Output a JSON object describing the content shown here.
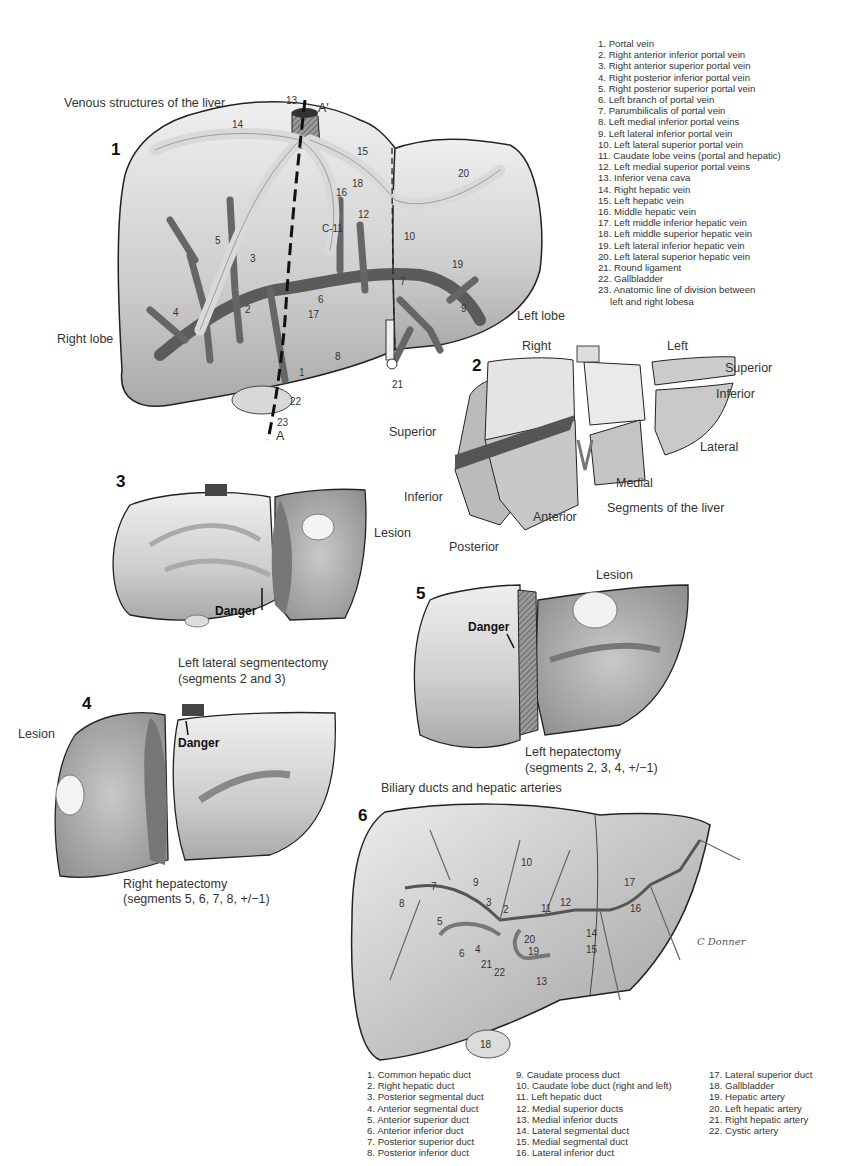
{
  "figure1": {
    "number": "1",
    "title": "Venous structures of the liver",
    "right_lobe_label": "Right lobe",
    "left_lobe_label": "Left lobe",
    "axis_top": "A′",
    "axis_bottom": "A",
    "markers": [
      "1",
      "2",
      "3",
      "4",
      "5",
      "6",
      "7",
      "8",
      "9",
      "10",
      "C-11",
      "12",
      "13",
      "14",
      "15",
      "16",
      "17",
      "18",
      "19",
      "20",
      "21",
      "22",
      "23"
    ],
    "legend": [
      "1. Portal vein",
      "2. Right anterior inferior portal vein",
      "3. Right anterior superior portal vein",
      "4. Right posterior inferior portal vein",
      "5. Right posterior superior portal vein",
      "6. Left branch of portal vein",
      "7. Parumbilicalis of portal vein",
      "8. Left medial inferior portal veins",
      "9. Left lateral inferior portal vein",
      "10. Left lateral superior portal vein",
      "11. Caudate lobe veins (portal and hepatic)",
      "12. Left medial superior portal veins",
      "13. Inferior vena cava",
      "14. Right hepatic vein",
      "15. Left hepatic vein",
      "16. Middle hepatic vein",
      "17.  Left middle inferior hepatic vein",
      "18. Left middle superior hepatic vein",
      "19. Left lateral inferior hepatic vein",
      "20. Left lateral superior hepatic vein",
      "21. Round ligament",
      "22. Gallbladder",
      "23. Anatomic line of division between",
      "left and right lobesa"
    ]
  },
  "figure2": {
    "number": "2",
    "title": "Segments of the liver",
    "labels": {
      "right": "Right",
      "left": "Left",
      "superior_left": "Superior",
      "inferior_left": "Inferior",
      "lateral": "Lateral",
      "superior_right": "Superior",
      "inferior_right": "Inferior",
      "medial": "Medial",
      "anterior": "Anterior",
      "posterior": "Posterior"
    }
  },
  "figure3": {
    "number": "3",
    "lesion": "Lesion",
    "danger": "Danger",
    "caption_line1": "Left lateral segmentectomy",
    "caption_line2": "(segments 2 and 3)"
  },
  "figure4": {
    "number": "4",
    "lesion": "Lesion",
    "danger": "Danger",
    "caption_line1": "Right hepatectomy",
    "caption_line2": "(segments 5, 6, 7, 8, +/−1)"
  },
  "figure5": {
    "number": "5",
    "lesion": "Lesion",
    "danger": "Danger",
    "caption_line1": "Left hepatectomy",
    "caption_line2": "(segments 2, 3, 4, +/−1)"
  },
  "figure6": {
    "number": "6",
    "title": "Biliary ducts and hepatic arteries",
    "signature": "C Donner",
    "legend_col1": [
      "1. Common hepatic duct",
      "2. Right hepatic duct",
      "3. Posterior segmental duct",
      "4. Anterior segmental duct",
      "5. Anterior superior duct",
      "6. Anterior inferior duct",
      "7. Posterior superior duct",
      "8. Posterior inferior duct"
    ],
    "legend_col2": [
      "9. Caudate process duct",
      "10. Caudate lobe duct (right and left)",
      "11. Left hepatic duct",
      "12. Medial superior ducts",
      "13. Medial inferior ducts",
      "14. Lateral segmental duct",
      "15. Medial segmental duct",
      "16. Lateral inferior duct"
    ],
    "legend_col3": [
      "17. Lateral superior duct",
      "18. Gallbladder",
      "19. Hepatic artery",
      "20. Left hepatic artery",
      "21. Right hepatic artery",
      "22. Cystic artery"
    ]
  },
  "colors": {
    "liver_light": "#e4e4e4",
    "liver_mid": "#bdbdbd",
    "liver_dark": "#8e8e8e",
    "vessel_dark": "#5a5a5a",
    "vessel_light": "#d6d6d6",
    "outline": "#222222"
  }
}
